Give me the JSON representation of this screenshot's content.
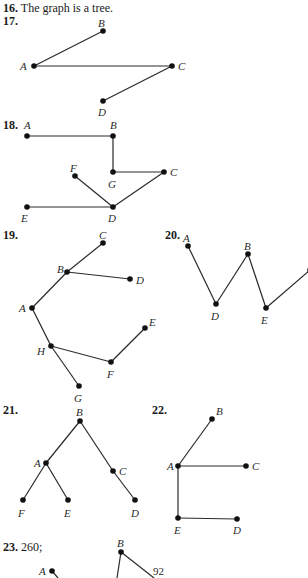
{
  "answers": [
    {
      "id": "16",
      "number": "16.",
      "text": "The graph is a tree."
    },
    {
      "id": "17",
      "number": "17."
    },
    {
      "id": "18",
      "number": "18."
    },
    {
      "id": "19",
      "number": "19."
    },
    {
      "id": "20",
      "number": "20."
    },
    {
      "id": "21",
      "number": "21."
    },
    {
      "id": "22",
      "number": "22."
    },
    {
      "id": "23",
      "number": "23.",
      "text": "260;"
    }
  ],
  "figures": {
    "fig17": {
      "vertices": [
        {
          "name": "A",
          "x": 34,
          "y": 66,
          "lx": 20,
          "ly": 60
        },
        {
          "name": "B",
          "x": 103,
          "y": 31,
          "lx": 98,
          "ly": 17
        },
        {
          "name": "C",
          "x": 172,
          "y": 66,
          "lx": 178,
          "ly": 60
        },
        {
          "name": "D",
          "x": 103,
          "y": 101,
          "lx": 98,
          "ly": 106
        }
      ],
      "edges": [
        [
          "A",
          "B"
        ],
        [
          "A",
          "C"
        ],
        [
          "C",
          "D"
        ]
      ]
    },
    "fig18": {
      "vertices": [
        {
          "name": "A",
          "x": 27,
          "y": 136,
          "lx": 24,
          "ly": 119
        },
        {
          "name": "B",
          "x": 113,
          "y": 136,
          "lx": 110,
          "ly": 119
        },
        {
          "name": "G",
          "x": 113,
          "y": 172,
          "lx": 108,
          "ly": 178
        },
        {
          "name": "C",
          "x": 164,
          "y": 172,
          "lx": 170,
          "ly": 166
        },
        {
          "name": "F",
          "x": 75,
          "y": 176,
          "lx": 70,
          "ly": 162
        },
        {
          "name": "D",
          "x": 113,
          "y": 207,
          "lx": 108,
          "ly": 212
        },
        {
          "name": "E",
          "x": 27,
          "y": 207,
          "lx": 21,
          "ly": 212
        }
      ],
      "edges": [
        [
          "A",
          "B"
        ],
        [
          "B",
          "G"
        ],
        [
          "G",
          "C"
        ],
        [
          "C",
          "D"
        ],
        [
          "F",
          "D"
        ],
        [
          "E",
          "D"
        ]
      ]
    },
    "fig19": {
      "vertices": [
        {
          "name": "C",
          "x": 103,
          "y": 243,
          "lx": 99,
          "ly": 229
        },
        {
          "name": "B",
          "x": 67,
          "y": 272,
          "lx": 57,
          "ly": 263
        },
        {
          "name": "D",
          "x": 130,
          "y": 279,
          "lx": 136,
          "ly": 274
        },
        {
          "name": "A",
          "x": 32,
          "y": 308,
          "lx": 19,
          "ly": 302
        },
        {
          "name": "H",
          "x": 51,
          "y": 346,
          "lx": 37,
          "ly": 345
        },
        {
          "name": "E",
          "x": 145,
          "y": 328,
          "lx": 149,
          "ly": 316
        },
        {
          "name": "F",
          "x": 111,
          "y": 362,
          "lx": 107,
          "ly": 368
        },
        {
          "name": "G",
          "x": 79,
          "y": 386,
          "lx": 74,
          "ly": 392
        }
      ],
      "edges": [
        [
          "C",
          "B"
        ],
        [
          "B",
          "D"
        ],
        [
          "B",
          "A"
        ],
        [
          "A",
          "H"
        ],
        [
          "H",
          "G"
        ],
        [
          "H",
          "F"
        ],
        [
          "F",
          "E"
        ]
      ]
    },
    "fig20": {
      "vertices": [
        {
          "name": "A",
          "x": 188,
          "y": 246,
          "lx": 183,
          "ly": 232
        },
        {
          "name": "D",
          "x": 216,
          "y": 304,
          "lx": 211,
          "ly": 310
        },
        {
          "name": "B",
          "x": 248,
          "y": 254,
          "lx": 244,
          "ly": 240
        },
        {
          "name": "E",
          "x": 266,
          "y": 308,
          "lx": 261,
          "ly": 314
        },
        {
          "name": "",
          "x": 310,
          "y": 270,
          "lx": 0,
          "ly": 0
        }
      ],
      "edges": [
        [
          "A",
          "D"
        ],
        [
          "D",
          "B"
        ],
        [
          "B",
          "E"
        ],
        [
          "E",
          ""
        ]
      ]
    },
    "fig21": {
      "vertices": [
        {
          "name": "B",
          "x": 80,
          "y": 421,
          "lx": 76,
          "ly": 406
        },
        {
          "name": "A",
          "x": 46,
          "y": 463,
          "lx": 34,
          "ly": 457
        },
        {
          "name": "C",
          "x": 113,
          "y": 471,
          "lx": 119,
          "ly": 465
        },
        {
          "name": "F",
          "x": 23,
          "y": 500,
          "lx": 18,
          "ly": 507
        },
        {
          "name": "E",
          "x": 68,
          "y": 500,
          "lx": 64,
          "ly": 507
        },
        {
          "name": "D",
          "x": 135,
          "y": 500,
          "lx": 131,
          "ly": 507
        }
      ],
      "edges": [
        [
          "B",
          "A"
        ],
        [
          "B",
          "C"
        ],
        [
          "C",
          "D"
        ],
        [
          "A",
          "F"
        ],
        [
          "A",
          "E"
        ]
      ]
    },
    "fig22": {
      "vertices": [
        {
          "name": "B",
          "x": 212,
          "y": 419,
          "lx": 216,
          "ly": 405
        },
        {
          "name": "A",
          "x": 178,
          "y": 466,
          "lx": 167,
          "ly": 460
        },
        {
          "name": "C",
          "x": 246,
          "y": 466,
          "lx": 252,
          "ly": 460
        },
        {
          "name": "E",
          "x": 178,
          "y": 518,
          "lx": 174,
          "ly": 524
        },
        {
          "name": "D",
          "x": 237,
          "y": 519,
          "lx": 233,
          "ly": 524
        }
      ],
      "edges": [
        [
          "A",
          "B"
        ],
        [
          "A",
          "C"
        ],
        [
          "A",
          "E"
        ],
        [
          "E",
          "D"
        ]
      ]
    },
    "fig23": {
      "vertices": [
        {
          "name": "B",
          "x": 121,
          "y": 552,
          "lx": 117,
          "ly": 537
        },
        {
          "name": "A",
          "x": 52,
          "y": 571,
          "lx": 39,
          "ly": 565
        }
      ],
      "edges": [],
      "partial_lines": [
        {
          "x1": 121,
          "y1": 552,
          "x2": 154,
          "y2": 578
        },
        {
          "x1": 121,
          "y1": 552,
          "x2": 117,
          "y2": 578
        },
        {
          "x1": 52,
          "y1": 571,
          "x2": 58,
          "y2": 578
        }
      ],
      "weights": [
        {
          "value": "92",
          "x": 153,
          "y": 565
        }
      ]
    }
  }
}
